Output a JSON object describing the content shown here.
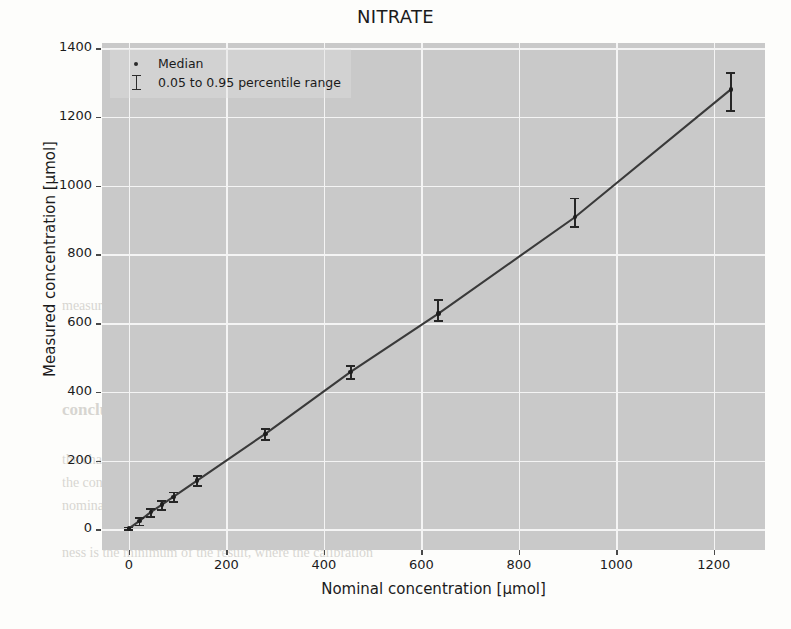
{
  "title": "NITRATE",
  "axes": {
    "xlabel": "Nominal concentration [µmol]",
    "ylabel": "Measured concentration [µmol]",
    "xticks": [
      "0",
      "200",
      "400",
      "600",
      "800",
      "1000",
      "1200"
    ],
    "yticks": [
      "0",
      "200",
      "400",
      "600",
      "800",
      "1000",
      "1200",
      "1400"
    ]
  },
  "legend": {
    "items": [
      {
        "label": "Median",
        "marker": "dot-marker"
      },
      {
        "label": "0.05 to 0.95 percentile range",
        "marker": "errorbar-marker"
      }
    ]
  },
  "colors": {
    "plot_background": "#c9c9c9",
    "grid": "#f4f4f4",
    "data": "#262626",
    "page_background": "#fdfdfb",
    "text": "#1b1b1b"
  },
  "chart_data": {
    "type": "line",
    "title": "NITRATE",
    "xlabel": "Nominal concentration [µmol]",
    "ylabel": "Measured concentration [µmol]",
    "xlim": [
      -55,
      1305
    ],
    "ylim": [
      -60,
      1415
    ],
    "grid": true,
    "legend_position": "upper left",
    "x": [
      0,
      22,
      45,
      68,
      92,
      140,
      280,
      455,
      635,
      915,
      1235
    ],
    "median": [
      2,
      25,
      50,
      72,
      95,
      142,
      278,
      458,
      628,
      908,
      1280
    ],
    "p05": [
      0,
      14,
      38,
      60,
      82,
      128,
      262,
      440,
      608,
      882,
      1220
    ],
    "p95": [
      8,
      36,
      62,
      86,
      110,
      158,
      294,
      478,
      670,
      965,
      1330
    ],
    "series": [
      {
        "name": "Median",
        "values": [
          2,
          25,
          50,
          72,
          95,
          142,
          278,
          458,
          628,
          908,
          1280
        ]
      },
      {
        "name": "0.05 percentile",
        "values": [
          0,
          14,
          38,
          60,
          82,
          128,
          262,
          440,
          608,
          882,
          1220
        ]
      },
      {
        "name": "0.95 percentile",
        "values": [
          8,
          36,
          62,
          86,
          110,
          158,
          294,
          478,
          670,
          965,
          1330
        ]
      }
    ]
  },
  "background_text": {
    "lines": [
      "a concentration of 1 mmol. The measuring response was",
      "was determined from the",
      "ness is the minimum of the result, where the calibration",
      "values, which are the high 0.95 percentile range of the results",
      "measurement is satisfactory",
      "onclusions",
      "conclusion of a more discriminating environmental issue",
      "the characterisation and that of analyte is determined",
      "the concentration unit for a sample. The assessment will",
      "nominal concentration 1 mmol which can be also as well"
    ]
  }
}
